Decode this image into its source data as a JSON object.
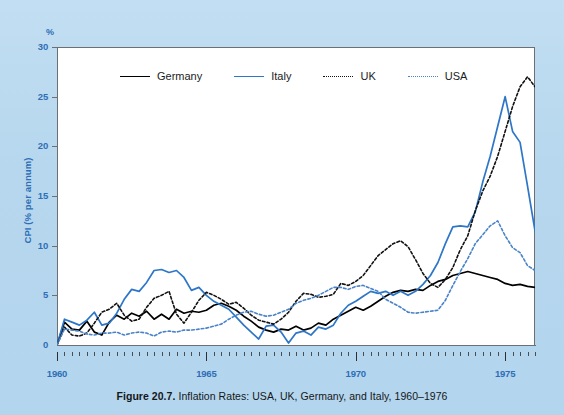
{
  "figure": {
    "caption_label": "Figure 20.7.",
    "caption_text": " Inflation Rates: USA, UK, Germany, and Italy, 1960–1976"
  },
  "legend": {
    "position": "top-left-inside",
    "items": [
      {
        "label": "Germany",
        "color": "#000000",
        "style": "solid",
        "icon": "line-solid-icon"
      },
      {
        "label": "Italy",
        "color": "#2d76c8",
        "style": "solid",
        "icon": "line-solid-icon"
      },
      {
        "label": "UK",
        "color": "#111111",
        "style": "dotted",
        "icon": "line-dotted-icon"
      },
      {
        "label": "USA",
        "color": "#4a83c9",
        "style": "dotted",
        "icon": "line-dotted-icon"
      }
    ]
  },
  "axes": {
    "y_unit_symbol": "%",
    "y_title": "CPI (% per annum)",
    "y_ticks": [
      0,
      5,
      10,
      15,
      20,
      25,
      30
    ],
    "x_ticks": [
      1960,
      1965,
      1970,
      1975
    ],
    "x_minor_step": 0.25
  },
  "colors": {
    "page_background": "#b9d9ef",
    "plot_background": "#ffffff",
    "axis_text": "#2f6eb5",
    "frame": "#6d6f72",
    "germany": "#000000",
    "italy": "#2d76c8",
    "uk": "#111111",
    "usa": "#4a83c9",
    "caption_text": "#15171a"
  },
  "chart_data": {
    "type": "line",
    "title": "Inflation Rates: USA, UK, Germany, and Italy, 1960–1976",
    "xlabel": "",
    "ylabel": "CPI (% per annum)",
    "xlim": [
      1960,
      1976
    ],
    "ylim": [
      0,
      30
    ],
    "grid": false,
    "legend_position": "upper left (inside axes)",
    "x": [
      1960.0,
      1960.25,
      1960.5,
      1960.75,
      1961.0,
      1961.25,
      1961.5,
      1961.75,
      1962.0,
      1962.25,
      1962.5,
      1962.75,
      1963.0,
      1963.25,
      1963.5,
      1963.75,
      1964.0,
      1964.25,
      1964.5,
      1964.75,
      1965.0,
      1965.25,
      1965.5,
      1965.75,
      1966.0,
      1966.25,
      1966.5,
      1966.75,
      1967.0,
      1967.25,
      1967.5,
      1967.75,
      1968.0,
      1968.25,
      1968.5,
      1968.75,
      1969.0,
      1969.25,
      1969.5,
      1969.75,
      1970.0,
      1970.25,
      1970.5,
      1970.75,
      1971.0,
      1971.25,
      1971.5,
      1971.75,
      1972.0,
      1972.25,
      1972.5,
      1972.75,
      1973.0,
      1973.25,
      1973.5,
      1973.75,
      1974.0,
      1974.25,
      1974.5,
      1974.75,
      1975.0,
      1975.25,
      1975.5,
      1975.75,
      1976.0
    ],
    "series": [
      {
        "name": "Germany",
        "color": "#000000",
        "style": "solid",
        "values": [
          0.0,
          2.3,
          1.6,
          1.5,
          2.4,
          1.3,
          1.0,
          2.3,
          3.0,
          2.6,
          3.2,
          2.9,
          3.4,
          2.6,
          3.1,
          2.6,
          3.6,
          3.2,
          3.4,
          3.3,
          3.5,
          4.0,
          4.2,
          3.9,
          3.5,
          2.9,
          2.4,
          1.8,
          1.5,
          1.3,
          1.6,
          1.5,
          1.9,
          1.5,
          1.7,
          2.2,
          2.0,
          2.6,
          3.0,
          3.4,
          3.8,
          3.5,
          3.9,
          4.4,
          4.9,
          5.3,
          5.5,
          5.4,
          5.6,
          5.5,
          6.0,
          6.4,
          6.6,
          7.0,
          7.2,
          7.4,
          7.2,
          7.0,
          6.8,
          6.6,
          6.2,
          6.0,
          6.1,
          5.9,
          5.8
        ]
      },
      {
        "name": "Italy",
        "color": "#2d76c8",
        "style": "solid",
        "values": [
          0.0,
          2.6,
          2.3,
          2.0,
          2.5,
          3.3,
          2.0,
          2.2,
          3.2,
          4.6,
          5.6,
          5.4,
          6.3,
          7.5,
          7.6,
          7.3,
          7.5,
          6.8,
          5.5,
          5.8,
          5.0,
          4.4,
          4.0,
          3.6,
          2.8,
          2.0,
          1.3,
          0.6,
          1.9,
          2.0,
          1.3,
          0.2,
          1.2,
          1.4,
          1.0,
          1.8,
          1.6,
          2.0,
          3.2,
          4.0,
          4.4,
          4.9,
          5.4,
          5.2,
          5.4,
          5.0,
          5.4,
          5.0,
          5.4,
          6.1,
          7.0,
          8.3,
          10.2,
          11.9,
          12.0,
          11.9,
          13.4,
          16.4,
          19.0,
          22.0,
          25.0,
          21.5,
          20.4,
          16.0,
          11.5
        ]
      },
      {
        "name": "UK",
        "color": "#111111",
        "style": "dotted",
        "values": [
          0.0,
          1.8,
          1.0,
          0.9,
          1.2,
          2.2,
          3.3,
          3.6,
          4.2,
          3.0,
          2.4,
          2.6,
          3.8,
          4.7,
          5.0,
          5.4,
          3.1,
          2.2,
          3.3,
          4.5,
          5.3,
          5.0,
          4.6,
          4.1,
          4.3,
          3.7,
          3.0,
          2.5,
          2.3,
          2.1,
          2.6,
          3.3,
          4.4,
          5.2,
          5.1,
          4.8,
          4.9,
          5.1,
          6.2,
          6.0,
          6.4,
          7.0,
          8.0,
          9.0,
          9.6,
          10.2,
          10.5,
          9.9,
          8.6,
          7.2,
          6.2,
          5.8,
          6.6,
          7.8,
          9.6,
          11.0,
          13.5,
          15.5,
          17.0,
          19.0,
          21.5,
          24.0,
          26.0,
          27.0,
          26.0
        ]
      },
      {
        "name": "USA",
        "color": "#4a83c9",
        "style": "dotted",
        "values": [
          0.0,
          1.6,
          1.5,
          1.4,
          1.1,
          1.0,
          1.2,
          1.2,
          1.3,
          1.0,
          1.2,
          1.3,
          1.2,
          0.9,
          1.3,
          1.4,
          1.3,
          1.5,
          1.5,
          1.6,
          1.7,
          1.9,
          2.1,
          2.6,
          3.0,
          3.3,
          3.4,
          3.1,
          2.9,
          3.0,
          3.3,
          3.6,
          4.2,
          4.5,
          4.7,
          5.0,
          5.4,
          5.8,
          5.8,
          5.6,
          5.9,
          6.0,
          5.7,
          5.4,
          4.6,
          4.2,
          3.8,
          3.3,
          3.2,
          3.3,
          3.4,
          3.5,
          4.5,
          6.0,
          7.4,
          8.7,
          10.2,
          11.1,
          12.0,
          12.5,
          11.0,
          9.8,
          9.3,
          8.0,
          7.5
        ]
      }
    ]
  }
}
